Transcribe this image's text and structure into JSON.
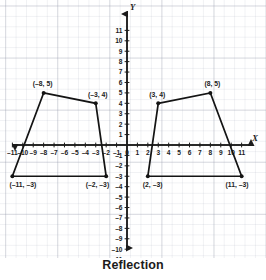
{
  "figure": {
    "caption": "Reflection",
    "axis_labels": {
      "x": "X",
      "y": "Y"
    }
  },
  "chart_data": {
    "type": "scatter",
    "title": "Reflection",
    "xlabel": "X",
    "ylabel": "Y",
    "xlim": [
      -11.5,
      11.5
    ],
    "ylim": [
      -11.5,
      11.5
    ],
    "grid": true,
    "legend": "none",
    "xticks": [
      -11,
      -10,
      -9,
      -8,
      -7,
      -6,
      -5,
      -4,
      -3,
      -2,
      -1,
      0,
      1,
      2,
      3,
      4,
      5,
      6,
      7,
      8,
      9,
      10,
      11
    ],
    "xtick_labels": [
      "–11",
      "–10",
      "–9",
      "–8",
      "–7",
      "–6",
      "–5",
      "–4",
      "–3",
      "–2",
      "–1",
      "0",
      "1",
      "2",
      "3",
      "4",
      "5",
      "6",
      "7",
      "8",
      "9",
      "10",
      "11"
    ],
    "yticks": [
      -11,
      -10,
      -9,
      -8,
      -7,
      -6,
      -5,
      -4,
      -3,
      -2,
      -1,
      1,
      2,
      3,
      4,
      5,
      6,
      7,
      8,
      9,
      10,
      11
    ],
    "ytick_labels": [
      "–11",
      "–10",
      "–9",
      "–8",
      "–7",
      "–6",
      "–5",
      "–4",
      "–3",
      "–2",
      "–1",
      "1",
      "2",
      "3",
      "4",
      "5",
      "6",
      "7",
      "8",
      "9",
      "10",
      "11"
    ],
    "series": [
      {
        "name": "pre-image",
        "closed": true,
        "points": [
          {
            "x": -8,
            "y": 5,
            "label": "(–8, 5)",
            "label_pos": "above-left"
          },
          {
            "x": -3,
            "y": 4,
            "label": "(–3, 4)",
            "label_pos": "above-right"
          },
          {
            "x": -2,
            "y": -3,
            "label": "(–2, –3)",
            "label_pos": "below-right"
          },
          {
            "x": -11,
            "y": -3,
            "label": "(–11, –3)",
            "label_pos": "below-left"
          }
        ]
      },
      {
        "name": "image",
        "closed": true,
        "points": [
          {
            "x": 3,
            "y": 4,
            "label": "(3, 4)",
            "label_pos": "above-left"
          },
          {
            "x": 8,
            "y": 5,
            "label": "(8, 5)",
            "label_pos": "above-right"
          },
          {
            "x": 11,
            "y": -3,
            "label": "(11, –3)",
            "label_pos": "below-right"
          },
          {
            "x": 2,
            "y": -3,
            "label": "(2, –3)",
            "label_pos": "below-left"
          }
        ]
      }
    ]
  }
}
